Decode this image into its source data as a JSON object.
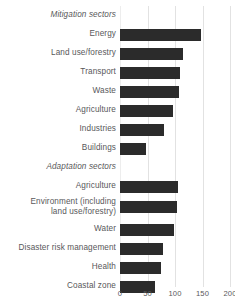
{
  "chart_data": {
    "type": "bar",
    "orientation": "horizontal",
    "title": "",
    "xlabel": "",
    "ylabel": "",
    "xlim": [
      0,
      215
    ],
    "xticks": [
      0,
      50,
      100,
      150,
      200
    ],
    "xtick_labels": [
      "0",
      "50",
      "100",
      "150",
      "200"
    ],
    "grid": true,
    "legend": false,
    "bar_color": "#2b2b2b",
    "grid_color": "#e2e2e2",
    "text_color": "#58585a",
    "sections": [
      {
        "heading": "Mitigation sectors",
        "categories": [
          "Energy",
          "Land use/forestry",
          "Transport",
          "Waste",
          "Agriculture",
          "Industries",
          "Buildings"
        ],
        "values": [
          147,
          114,
          109,
          107,
          96,
          80,
          47
        ]
      },
      {
        "heading": "Adaptation sectors",
        "categories": [
          "Agriculture",
          "Environment (including\nland use/forestry)",
          "Water",
          "Disaster risk management",
          "Health",
          "Coastal zone"
        ],
        "values": [
          106,
          104,
          98,
          78,
          74,
          63
        ]
      }
    ],
    "categories": [
      "Energy",
      "Land use/forestry",
      "Transport",
      "Waste",
      "Agriculture",
      "Industries",
      "Buildings",
      "Agriculture",
      "Environment (including land use/forestry)",
      "Water",
      "Disaster risk management",
      "Health",
      "Coastal zone"
    ],
    "values": [
      147,
      114,
      109,
      107,
      96,
      80,
      47,
      106,
      104,
      98,
      78,
      74,
      63
    ]
  },
  "rows": [
    {
      "label": "Mitigation sectors",
      "kind": "section"
    },
    {
      "label": "Energy",
      "value": 147
    },
    {
      "label": "Land use/forestry",
      "value": 114
    },
    {
      "label": "Transport",
      "value": 109
    },
    {
      "label": "Waste",
      "value": 107
    },
    {
      "label": "Agriculture",
      "value": 96
    },
    {
      "label": "Industries",
      "value": 80
    },
    {
      "label": "Buildings",
      "value": 47
    },
    {
      "label": "Adaptation sectors",
      "kind": "section"
    },
    {
      "label": "Agriculture",
      "value": 106
    },
    {
      "label": "Environment (including\nland use/forestry)",
      "value": 104,
      "kind": "tall"
    },
    {
      "label": "Water",
      "value": 98
    },
    {
      "label": "Disaster risk management",
      "value": 78
    },
    {
      "label": "Health",
      "value": 74
    },
    {
      "label": "Coastal zone",
      "value": 63
    }
  ],
  "axis": {
    "ticks": [
      "0",
      "50",
      "100",
      "150",
      "200"
    ],
    "tick_values": [
      0,
      50,
      100,
      150,
      200
    ]
  }
}
